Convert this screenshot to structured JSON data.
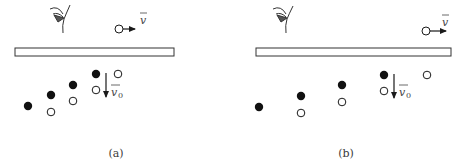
{
  "panels": [
    {
      "id": "a",
      "caption": "(a)",
      "observer": "eye-icon",
      "moving_source": {
        "label": "v",
        "direction": "right"
      },
      "emission_velocity": {
        "label": "v",
        "subscript": "0",
        "direction": "down"
      },
      "filled_particles": 4,
      "open_particles": 4
    },
    {
      "id": "b",
      "caption": "(b)",
      "observer": "eye-icon",
      "moving_source": {
        "label": "v",
        "direction": "right"
      },
      "emission_velocity": {
        "label": "v",
        "subscript": "0",
        "direction": "down"
      },
      "filled_particles": 4,
      "open_particles": 4
    }
  ],
  "colors": {
    "ink": "#1a1a1a",
    "outline": "#444444"
  }
}
